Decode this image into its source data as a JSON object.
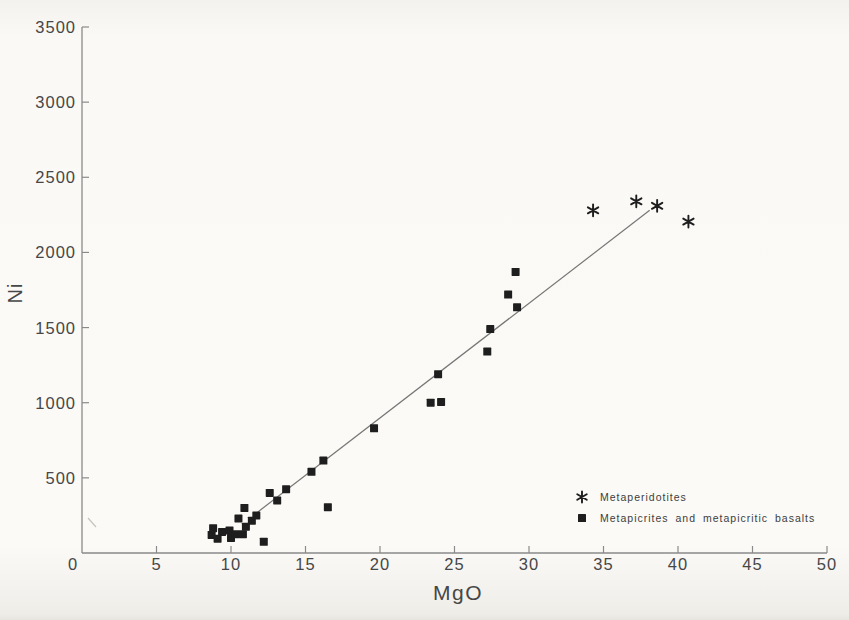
{
  "page": {
    "ink": "#1e1e1e",
    "text_color": "#474747",
    "axis_color": "#8a8a8a",
    "trendline_color": "#767676",
    "paper_color": "#f9f8f4"
  },
  "chart_data": {
    "type": "scatter",
    "title": "",
    "xlabel": "MgO",
    "ylabel": "Ni",
    "xlim": [
      0,
      50
    ],
    "ylim": [
      0,
      3500
    ],
    "x_ticks": [
      0,
      5,
      10,
      15,
      20,
      25,
      30,
      35,
      40,
      45,
      50
    ],
    "y_ticks": [
      500,
      1000,
      1500,
      2000,
      2500,
      3000,
      3500
    ],
    "grid": false,
    "legend_position": "inside lower right",
    "series": [
      {
        "name": "Metaperidotites",
        "marker": "asterisk",
        "points": [
          [
            34.3,
            2280
          ],
          [
            37.2,
            2340
          ],
          [
            38.6,
            2310
          ],
          [
            40.7,
            2205
          ]
        ]
      },
      {
        "name": "Metapicrites and metapicritic basalts",
        "marker": "square",
        "points": [
          [
            8.7,
            120
          ],
          [
            8.8,
            165
          ],
          [
            9.1,
            95
          ],
          [
            9.4,
            140
          ],
          [
            9.9,
            150
          ],
          [
            10.0,
            100
          ],
          [
            10.3,
            125
          ],
          [
            10.5,
            230
          ],
          [
            10.8,
            125
          ],
          [
            10.9,
            300
          ],
          [
            11.0,
            175
          ],
          [
            11.4,
            215
          ],
          [
            11.7,
            250
          ],
          [
            12.2,
            75
          ],
          [
            12.6,
            400
          ],
          [
            13.1,
            350
          ],
          [
            13.7,
            425
          ],
          [
            15.4,
            540
          ],
          [
            16.2,
            615
          ],
          [
            16.5,
            305
          ],
          [
            19.6,
            830
          ],
          [
            23.4,
            1000
          ],
          [
            23.9,
            1190
          ],
          [
            24.1,
            1005
          ],
          [
            27.2,
            1340
          ],
          [
            27.4,
            1490
          ],
          [
            28.6,
            1720
          ],
          [
            29.1,
            1870
          ],
          [
            29.2,
            1635
          ]
        ]
      }
    ],
    "trendline": {
      "x1": 11.5,
      "y1": 250,
      "x2": 38.1,
      "y2": 2280
    }
  }
}
